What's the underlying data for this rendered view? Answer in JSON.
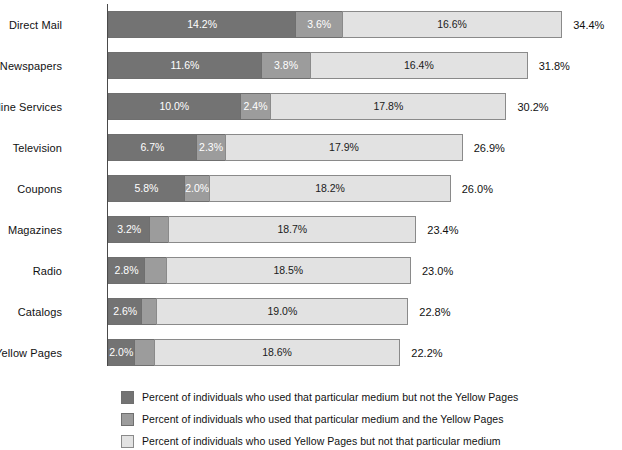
{
  "chart_data": {
    "type": "bar",
    "orientation": "horizontal",
    "stacked": true,
    "title": "",
    "subtitle": "",
    "xlabel": "",
    "ylabel": "",
    "xlim": [
      0,
      34.4
    ],
    "grid": false,
    "legend_position": "bottom",
    "categories": [
      "Direct Mail",
      "Newspapers",
      "Online Services",
      "Television",
      "Coupons",
      "Magazines",
      "Radio",
      "Catalogs",
      "Internet Yellow Pages"
    ],
    "series": [
      {
        "name": "Percent of individuals who used that particular medium but not the Yellow Pages",
        "color": "#737373",
        "values": [
          14.2,
          11.6,
          10.0,
          6.7,
          5.8,
          3.2,
          2.8,
          2.6,
          2.0
        ],
        "labels": [
          "14.2%",
          "11.6%",
          "10.0%",
          "6.7%",
          "5.8%",
          "3.2%",
          "2.8%",
          "2.6%",
          "2.0%"
        ]
      },
      {
        "name": "Percent of individuals who used that particular medium and the Yellow Pages",
        "color": "#9c9c9c",
        "values": [
          3.6,
          3.8,
          2.4,
          2.3,
          2.0,
          1.5,
          1.7,
          1.2,
          1.6
        ],
        "labels": [
          "3.6%",
          "3.8%",
          "2.4%",
          "2.3%",
          "2.0%",
          "1.5",
          "1.7",
          "1.2",
          "1.6"
        ]
      },
      {
        "name": "Percent of individuals who used Yellow Pages but not that particular medium",
        "color": "#e2e2e2",
        "values": [
          16.6,
          16.4,
          17.8,
          17.9,
          18.2,
          18.7,
          18.5,
          19.0,
          18.6
        ],
        "labels": [
          "16.6%",
          "16.4%",
          "17.8%",
          "17.9%",
          "18.2%",
          "18.7%",
          "18.5%",
          "19.0%",
          "18.6%"
        ]
      }
    ],
    "totals": [
      34.4,
      31.8,
      30.2,
      26.9,
      26.0,
      23.4,
      23.0,
      22.8,
      22.2
    ],
    "total_labels": [
      "34.4%",
      "31.8%",
      "30.2%",
      "26.9%",
      "26.0%",
      "23.4%",
      "23.0%",
      "22.8%",
      "22.2%"
    ]
  },
  "legend": {
    "items": [
      {
        "swatch": "sw-a",
        "color": "#737373",
        "label": "Percent of individuals who used that particular medium but not the Yellow Pages"
      },
      {
        "swatch": "sw-b",
        "color": "#9c9c9c",
        "label": "Percent of individuals who used that particular medium and the Yellow Pages"
      },
      {
        "swatch": "sw-c",
        "color": "#e2e2e2",
        "label": "Percent of individuals who used Yellow Pages but not that particular medium"
      }
    ]
  },
  "layout": {
    "axis_x": 108,
    "row_top": 11,
    "row_pitch": 41,
    "row_height": 27,
    "px_per_percent": 13.26,
    "min_label_width_px": 26
  }
}
